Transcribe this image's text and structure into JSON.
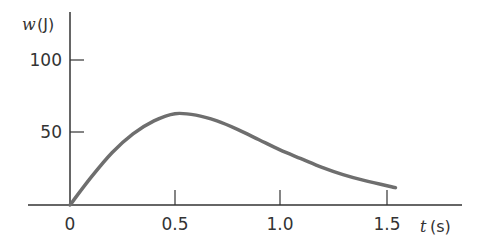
{
  "chart_data": {
    "type": "line",
    "title": "",
    "xlabel": "t (s)",
    "ylabel": "w (J)",
    "xlabel_var": "t",
    "xlabel_unit": "(s)",
    "ylabel_var": "w",
    "ylabel_unit": "(J)",
    "x_ticks": [
      "0",
      "0.5",
      "1.0",
      "1.5"
    ],
    "y_ticks": [
      "50",
      "100"
    ],
    "xlim": [
      0,
      1.55
    ],
    "ylim": [
      0,
      100
    ],
    "grid": false,
    "legend": null,
    "series": [
      {
        "name": "w(t)",
        "color": "#6e6e6e",
        "x": [
          0,
          0.1,
          0.2,
          0.3,
          0.4,
          0.5,
          0.6,
          0.7,
          0.8,
          0.9,
          1.0,
          1.1,
          1.2,
          1.3,
          1.4,
          1.55
        ],
        "values": [
          0,
          19,
          36,
          49,
          58,
          63,
          62,
          58,
          52,
          45,
          38,
          32,
          26,
          21,
          17,
          12
        ]
      }
    ]
  }
}
